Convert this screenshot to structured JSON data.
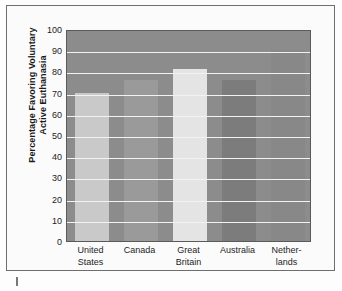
{
  "chart_data": {
    "type": "bar",
    "title": "",
    "xlabel": "",
    "ylabel": "Percentage Favoring Voluntary Active Euthanasia",
    "ylabel_lines": [
      "Percentage Favoring Voluntary",
      "Active Euthanasia"
    ],
    "categories": [
      "United States",
      "Canada",
      "Great Britain",
      "Australia",
      "Netherlands"
    ],
    "category_lines": [
      [
        "United",
        "States"
      ],
      [
        "Canada",
        ""
      ],
      [
        "Great",
        "Britain"
      ],
      [
        "Australia",
        ""
      ],
      [
        "Nether-",
        "lands"
      ]
    ],
    "values": [
      70,
      76,
      81,
      76,
      90
    ],
    "ylim": [
      0,
      100
    ],
    "yticks": [
      0,
      10,
      20,
      30,
      40,
      50,
      60,
      70,
      80,
      90,
      100
    ],
    "grid": true,
    "legend": "none",
    "bar_colors": [
      "#c9c9c9",
      "#9a9a9a",
      "#e4e4e4",
      "#7c7c7c",
      "#888888"
    ],
    "plot_background": "#8c8c8c",
    "gridline_color": "#f2f2f2"
  }
}
